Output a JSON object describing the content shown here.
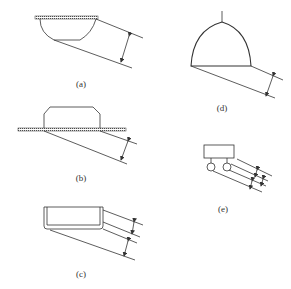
{
  "figure": {
    "panels": [
      {
        "id": "a",
        "label": "(a)",
        "description": "bowl-shaped fixture mounted under hatched ceiling plate, dimension arrow between slanted parallel lines"
      },
      {
        "id": "b",
        "label": "(b)",
        "description": "trapezoidal low-profile fixture on hatched plate, dimension arrow between slanted parallel lines"
      },
      {
        "id": "c",
        "label": "(c)",
        "description": "rectangular tray-shaped fixture with two dimension arrows between slanted parallel lines"
      },
      {
        "id": "d",
        "label": "(d)",
        "description": "pendant dome fixture on stem, dimension arrow between slanted parallel lines"
      },
      {
        "id": "e",
        "label": "(e)",
        "description": "box fixture with two round lamps, three dimension arrows between slanted parallel lines"
      }
    ]
  },
  "colors": {
    "line": "#333333",
    "background": "#ffffff"
  }
}
